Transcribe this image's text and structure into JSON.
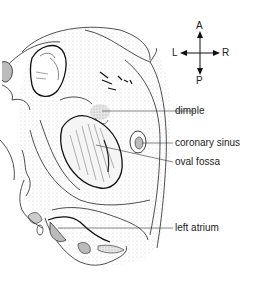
{
  "figure": {
    "compass": {
      "top": "A",
      "bottom": "P",
      "left": "L",
      "right": "R"
    },
    "labels": [
      {
        "id": "dimple",
        "text": "dimple"
      },
      {
        "id": "coronary_sinus",
        "text": "coronary sinus"
      },
      {
        "id": "oval_fossa",
        "text": "oval fossa"
      },
      {
        "id": "left_atrium",
        "text": "left atrium"
      }
    ]
  }
}
